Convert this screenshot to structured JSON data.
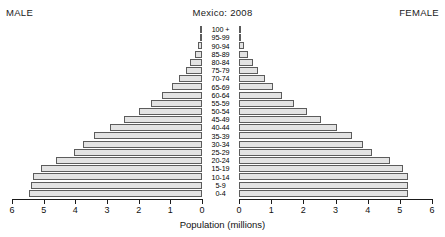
{
  "header": {
    "male_label": "MALE",
    "female_label": "FEMALE",
    "title": "Mexico: 2008"
  },
  "axis": {
    "x_title": "Population (millions)",
    "left_ticks": [
      "6",
      "5",
      "4",
      "3",
      "2",
      "1",
      "0"
    ],
    "right_ticks": [
      "0",
      "1",
      "2",
      "3",
      "4",
      "5",
      "6"
    ]
  },
  "colors": {
    "bar_fill": "#e3e3e3",
    "bar_stroke": "#5c5c5c",
    "axis": "#1a1a1a",
    "text": "#000000"
  },
  "chart_data": {
    "type": "bar",
    "subtype": "population-pyramid",
    "title": "Mexico: 2008",
    "xlabel": "Population (millions)",
    "ylabel": "",
    "xlim": [
      0,
      6
    ],
    "grid": false,
    "legend": [
      "MALE",
      "FEMALE"
    ],
    "legend_position": "top-corners",
    "categories": [
      "100 +",
      "95 - 99",
      "90 - 94",
      "85 - 89",
      "80 - 84",
      "75 - 79",
      "70 - 74",
      "65 - 69",
      "60 - 64",
      "55 - 59",
      "50 - 54",
      "45 - 49",
      "40 - 44",
      "35 - 39",
      "30 - 34",
      "25 - 29",
      "20 - 24",
      "15 - 19",
      "10 - 14",
      "5 - 9",
      "0 - 4"
    ],
    "series": [
      {
        "name": "MALE",
        "side": "left",
        "values": [
          0.01,
          0.05,
          0.12,
          0.22,
          0.38,
          0.52,
          0.72,
          0.95,
          1.25,
          1.6,
          2.0,
          2.45,
          2.9,
          3.4,
          3.75,
          4.05,
          4.6,
          5.1,
          5.35,
          5.4,
          5.45
        ]
      },
      {
        "name": "FEMALE",
        "side": "right",
        "values": [
          0.02,
          0.07,
          0.16,
          0.28,
          0.45,
          0.6,
          0.8,
          1.05,
          1.35,
          1.7,
          2.1,
          2.55,
          3.05,
          3.5,
          3.85,
          4.15,
          4.7,
          5.1,
          5.25,
          5.25,
          5.25
        ]
      }
    ]
  }
}
